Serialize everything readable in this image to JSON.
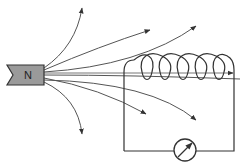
{
  "diagram": {
    "magnet": {
      "label": "N",
      "fill": "#9a9a9a",
      "pole": "north"
    },
    "coil": {
      "turns": 5,
      "stroke": "#333333"
    },
    "meter": {
      "type": "galvanometer",
      "icon": "galvanometer-icon"
    },
    "field_lines": {
      "count": 8,
      "stroke": "#555555",
      "arrowheads": true
    },
    "colors": {
      "line": "#333333",
      "field": "#555555",
      "magnet": "#9a9a9a",
      "background": "#ffffff"
    }
  }
}
